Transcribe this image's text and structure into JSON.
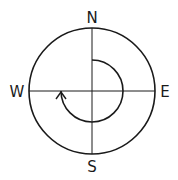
{
  "diagram": {
    "type": "compass-rotation",
    "labels": {
      "north": "N",
      "east": "E",
      "south": "S",
      "west": "W"
    },
    "rotation": {
      "start": "N",
      "end": "W",
      "direction": "clockwise",
      "degrees": 270
    },
    "colors": {
      "stroke": "#1a1a1a",
      "background": "#ffffff"
    }
  }
}
